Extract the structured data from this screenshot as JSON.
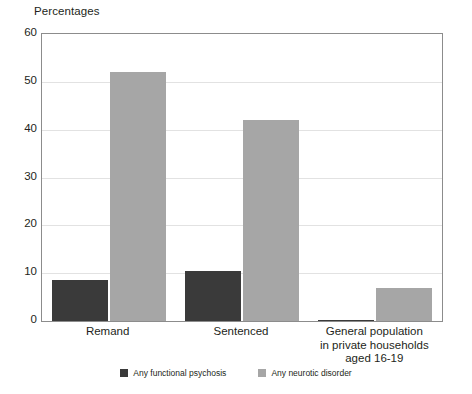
{
  "chart_data": {
    "type": "bar",
    "title": "Percentages",
    "xlabel": "",
    "ylabel": "Percentages",
    "ylim": [
      0,
      60
    ],
    "yticks": [
      0,
      10,
      20,
      30,
      40,
      50,
      60
    ],
    "ytick_labels": [
      "0",
      "10",
      "20",
      "30",
      "40",
      "50",
      "60"
    ],
    "grid": true,
    "legend_position": "bottom",
    "categories": [
      "Remand",
      "Sentenced",
      "General population in private households aged 16-19"
    ],
    "category_lines": [
      [
        "Remand"
      ],
      [
        "Sentenced"
      ],
      [
        "General population",
        "in private households",
        "aged 16-19"
      ]
    ],
    "series": [
      {
        "name": "Any functional psychosis",
        "color": "#3a3a3a",
        "values": [
          8.5,
          10.5,
          0.3
        ]
      },
      {
        "name": "Any neurotic disorder",
        "color": "#a6a6a6",
        "values": [
          52,
          42,
          7
        ]
      }
    ]
  },
  "colors": {
    "series_dark": "#3a3a3a",
    "series_gray": "#a6a6a6",
    "gridline": "#e2e2e2",
    "frame": "#8c8c8c",
    "text": "#231f20",
    "background": "#ffffff"
  }
}
